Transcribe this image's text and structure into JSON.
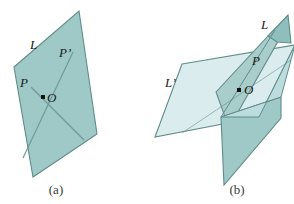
{
  "figure": {
    "type": "geometry-diagram",
    "background_color": "#ffffff",
    "colors": {
      "plane_dark": "#9ec9c6",
      "plane_light": "#dbecef",
      "plane_mid": "#a8cdcb",
      "plane_shadow": "#8fbfbc",
      "stroke": "#5f8c8a",
      "line": "#6e9b98",
      "label_text": "#1a1a1a",
      "caption_text": "#3a3a3a",
      "point_marker": "#111111"
    },
    "panels": [
      {
        "id": "a",
        "caption": "(a)",
        "labels": [
          {
            "name": "line-label-L",
            "text": "L",
            "x": 30,
            "y": 49
          },
          {
            "name": "point-label-P-prime",
            "text": "P’",
            "x": 60,
            "y": 57
          },
          {
            "name": "point-label-P",
            "text": "P",
            "x": 21,
            "y": 86
          },
          {
            "name": "point-label-O",
            "text": "O",
            "x": 48,
            "y": 101
          }
        ],
        "point_markers": [
          {
            "name": "origin-point-O",
            "x": 43,
            "y": 97
          }
        ]
      },
      {
        "id": "b",
        "caption": "(b)",
        "labels": [
          {
            "name": "line-label-L",
            "text": "L",
            "x": 262,
            "y": 28
          },
          {
            "name": "line-label-L-prime",
            "text": "L’",
            "x": 167,
            "y": 86
          },
          {
            "name": "point-label-P",
            "text": "P",
            "x": 253,
            "y": 64
          },
          {
            "name": "point-label-O",
            "text": "O",
            "x": 246,
            "y": 93
          }
        ],
        "point_markers": [
          {
            "name": "origin-point-O",
            "x": 239,
            "y": 90
          }
        ]
      }
    ]
  }
}
